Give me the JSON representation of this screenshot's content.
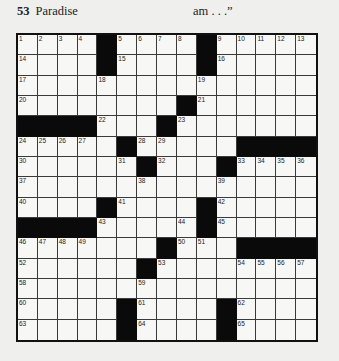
{
  "header": {
    "clue_left_number": "53",
    "clue_left_text": "Paradise",
    "clue_right_text": "am . . .”"
  },
  "puzzle": {
    "size": 15,
    "rows": [
      [
        "1",
        "2",
        "3",
        "4",
        "#",
        "5",
        "6",
        "7",
        "8",
        "#",
        "9",
        "10",
        "11",
        "12",
        "13"
      ],
      [
        "14",
        "",
        "",
        "",
        "#",
        "15",
        "",
        "",
        "",
        "#",
        "16",
        "",
        "",
        "",
        ""
      ],
      [
        "17",
        "",
        "",
        "",
        "18",
        "",
        "",
        "",
        "",
        "19",
        "",
        "",
        "",
        "",
        ""
      ],
      [
        "20",
        "",
        "",
        "",
        "",
        "",
        "",
        "",
        "#",
        "21",
        "",
        "",
        "",
        "",
        ""
      ],
      [
        "#",
        "#",
        "#",
        "#",
        "22",
        "",
        "",
        "#",
        "23",
        "",
        "",
        "",
        "",
        "",
        ""
      ],
      [
        "24",
        "25",
        "26",
        "27",
        "",
        "#",
        "28",
        "29",
        "",
        "",
        "",
        "#",
        "#",
        "#",
        "#"
      ],
      [
        "30",
        "",
        "",
        "",
        "",
        "31",
        "#",
        "32",
        "",
        "",
        "#",
        "33",
        "34",
        "35",
        "36"
      ],
      [
        "37",
        "",
        "",
        "",
        "",
        "",
        "38",
        "",
        "",
        "",
        "39",
        "",
        "",
        "",
        ""
      ],
      [
        "40",
        "",
        "",
        "",
        "#",
        "41",
        "",
        "",
        "",
        "#",
        "42",
        "",
        "",
        "",
        ""
      ],
      [
        "#",
        "#",
        "#",
        "#",
        "43",
        "",
        "",
        "",
        "44",
        "#",
        "45",
        "",
        "",
        "",
        ""
      ],
      [
        "46",
        "47",
        "48",
        "49",
        "",
        "",
        "",
        "#",
        "50",
        "51",
        "",
        "#",
        "#",
        "#",
        "#"
      ],
      [
        "52",
        "",
        "",
        "",
        "",
        "",
        "#",
        "53",
        "",
        "",
        "",
        "54",
        "55",
        "56",
        "57"
      ],
      [
        "58",
        "",
        "",
        "",
        "",
        "",
        "59",
        "",
        "",
        "",
        "",
        "",
        "",
        "",
        ""
      ],
      [
        "60",
        "",
        "",
        "",
        "",
        "#",
        "61",
        "",
        "",
        "",
        "#",
        "62",
        "",
        "",
        ""
      ],
      [
        "63",
        "",
        "",
        "",
        "",
        "#",
        "64",
        "",
        "",
        "",
        "#",
        "65",
        "",
        "",
        ""
      ]
    ]
  }
}
